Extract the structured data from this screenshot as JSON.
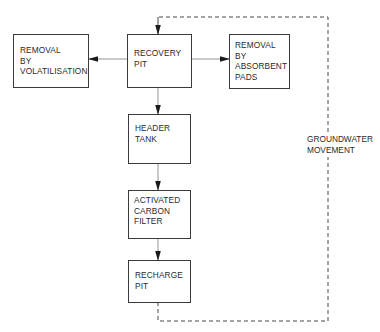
{
  "diagram": {
    "nodes": [
      {
        "id": "recovery_pit",
        "lines": [
          "RECOVERY",
          "PIT"
        ]
      },
      {
        "id": "removal_volatilisation",
        "lines": [
          "REMOVAL",
          "BY",
          "VOLATILISATION"
        ]
      },
      {
        "id": "removal_absorbent_pads",
        "lines": [
          "REMOVAL",
          "BY",
          "ABSORBENT",
          "PADS"
        ]
      },
      {
        "id": "header_tank",
        "lines": [
          "HEADER",
          "TANK"
        ]
      },
      {
        "id": "activated_carbon_filter",
        "lines": [
          "ACTIVATED",
          "CARBON",
          "FILTER"
        ]
      },
      {
        "id": "recharge_pit",
        "lines": [
          "RECHARGE",
          "PIT"
        ]
      }
    ],
    "edges": [
      {
        "from": "recovery_pit",
        "to": "removal_volatilisation",
        "style": "solid"
      },
      {
        "from": "recovery_pit",
        "to": "removal_absorbent_pads",
        "style": "solid"
      },
      {
        "from": "recovery_pit",
        "to": "header_tank",
        "style": "solid"
      },
      {
        "from": "header_tank",
        "to": "activated_carbon_filter",
        "style": "solid"
      },
      {
        "from": "activated_carbon_filter",
        "to": "recharge_pit",
        "style": "solid"
      },
      {
        "from": "recharge_pit",
        "to": "recovery_pit",
        "style": "dashed",
        "label": "groundwater_movement"
      }
    ],
    "groundwater_movement": {
      "lines": [
        "GROUNDWATER",
        "MOVEMENT"
      ]
    }
  }
}
